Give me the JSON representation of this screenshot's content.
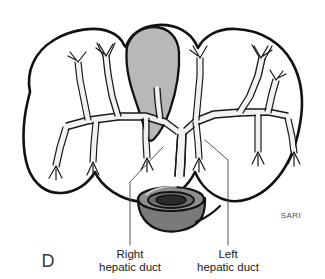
{
  "figure": {
    "panel_letter": "D",
    "signature": "SARI",
    "background_color": "#ffffff",
    "outline_color": "#111111",
    "duct_fill_color": "#f2f2f2",
    "duct_outline_color": "#1a1a1a",
    "gallbladder_fill_color": "#b8b8b8",
    "gallbladder_outline_color": "#111111",
    "stump_fill_color": "#7a7a7a",
    "stump_top_fill_color": "#8e8e8e",
    "stump_lumen_color": "#2b2b2b",
    "leader_line_color": "#555555"
  },
  "labels": [
    {
      "id": "right-hepatic-duct",
      "line1": "Right",
      "line2": "hepatic duct",
      "text_x": 130,
      "line1_y": 258,
      "line2_y": 271,
      "leader": {
        "x1": 163,
        "y1": 147,
        "x2": 130,
        "y2": 182,
        "x3": 130,
        "y3": 245
      }
    },
    {
      "id": "left-hepatic-duct",
      "line1": "Left",
      "line2": "hepatic duct",
      "text_x": 228,
      "line1_y": 258,
      "line2_y": 271,
      "leader": {
        "x1": 205,
        "y1": 140,
        "x2": 228,
        "y2": 160,
        "x3": 228,
        "y3": 245
      }
    }
  ],
  "anatomy": {
    "liver_label": "liver",
    "gallbladder_label": "gallbladder",
    "duct_stump_label": "common-hepatic-duct-stump",
    "right_lobe_label": "right-lobe",
    "left_lobe_label": "left-lobe",
    "duct_tree_label": "intrahepatic-biliary-tree"
  }
}
